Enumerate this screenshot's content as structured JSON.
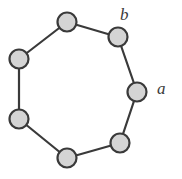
{
  "figure": {
    "title": "",
    "type": "cycle-graph",
    "background_color": "#ffffff",
    "canvas": {
      "width": 182,
      "height": 179
    }
  },
  "style": {
    "node_fill": "#d4d4d4",
    "node_stroke": "#3a3a3a",
    "node_stroke_width": 2.2,
    "node_radius": 9.5,
    "edge_stroke": "#3a3a3a",
    "edge_stroke_width": 2.2,
    "label_color": "#3a3a3a"
  },
  "graph": {
    "vertex_count": 7,
    "edge_count": 7,
    "nodes": [
      {
        "id": "n0",
        "name": "vertex-top",
        "cx": 67,
        "cy": 22
      },
      {
        "id": "n1",
        "name": "vertex-top-right",
        "cx": 118,
        "cy": 37
      },
      {
        "id": "n2",
        "name": "vertex-right",
        "cx": 137,
        "cy": 92
      },
      {
        "id": "n3",
        "name": "vertex-bottom-right",
        "cx": 120,
        "cy": 143
      },
      {
        "id": "n4",
        "name": "vertex-bottom",
        "cx": 67,
        "cy": 158
      },
      {
        "id": "n5",
        "name": "vertex-bottom-left",
        "cx": 19,
        "cy": 119
      },
      {
        "id": "n6",
        "name": "vertex-left",
        "cx": 19,
        "cy": 59
      }
    ],
    "edges": [
      {
        "id": "e0",
        "name": "edge-top-to-top-right",
        "from": "n0",
        "to": "n1"
      },
      {
        "id": "e1",
        "name": "edge-b",
        "from": "n1",
        "to": "n2",
        "label": "b"
      },
      {
        "id": "e2",
        "name": "edge-a",
        "from": "n2",
        "to": "n3",
        "label": "a"
      },
      {
        "id": "e3",
        "name": "edge-bottom-right-to-bottom",
        "from": "n3",
        "to": "n4"
      },
      {
        "id": "e4",
        "name": "edge-bottom-to-bottom-left",
        "from": "n4",
        "to": "n5"
      },
      {
        "id": "e5",
        "name": "edge-bottom-left-to-left",
        "from": "n5",
        "to": "n6"
      },
      {
        "id": "e6",
        "name": "edge-left-to-top",
        "from": "n6",
        "to": "n0"
      }
    ]
  },
  "labels": [
    {
      "id": "label-b",
      "name": "label-b",
      "text": "b",
      "x": 120,
      "y": 6
    },
    {
      "id": "label-a",
      "name": "label-a",
      "text": "a",
      "x": 157,
      "y": 80
    }
  ]
}
